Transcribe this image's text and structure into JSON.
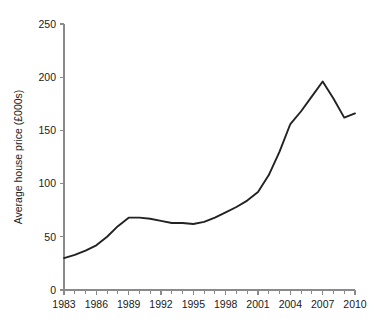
{
  "chart_data": {
    "type": "line",
    "title": "",
    "xlabel": "",
    "ylabel": "Average house price (£000s)",
    "xlim": [
      1983,
      2010
    ],
    "ylim": [
      0,
      250
    ],
    "grid": false,
    "legend": "none",
    "yticks": [
      0,
      50,
      100,
      150,
      200,
      250
    ],
    "ytick_labels": [
      "0",
      "50",
      "100",
      "150",
      "200",
      "250"
    ],
    "xticks": [
      1983,
      1986,
      1989,
      1992,
      1995,
      1998,
      2001,
      2004,
      2007,
      2010
    ],
    "xtick_labels": [
      "1983",
      "1986",
      "1989",
      "1992",
      "1995",
      "1998",
      "2001",
      "2004",
      "2007",
      "2010"
    ],
    "x_minor_tick_interval": 1,
    "x": [
      1983,
      1984,
      1985,
      1986,
      1987,
      1988,
      1989,
      1990,
      1991,
      1992,
      1993,
      1994,
      1995,
      1996,
      1997,
      1998,
      1999,
      2000,
      2001,
      2002,
      2003,
      2004,
      2005,
      2006,
      2007,
      2008,
      2009,
      2010
    ],
    "series": [
      {
        "name": "Average house price",
        "color": "#222222",
        "values": [
          30,
          33,
          37,
          42,
          50,
          60,
          68,
          68,
          67,
          65,
          63,
          63,
          62,
          64,
          68,
          73,
          78,
          84,
          92,
          108,
          130,
          156,
          168,
          182,
          196,
          180,
          162,
          166
        ]
      }
    ],
    "annotations": []
  }
}
